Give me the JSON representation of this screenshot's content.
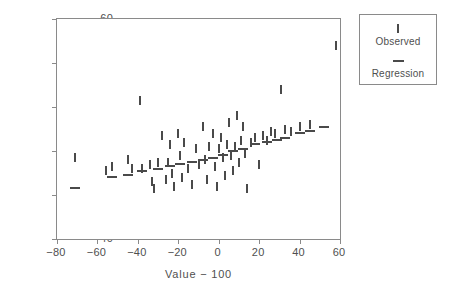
{
  "chart_data": {
    "type": "scatter",
    "title": "",
    "xlabel": "Value − 100",
    "ylabel": "",
    "xlim": [
      -80,
      60
    ],
    "ylim": [
      -40,
      60
    ],
    "xticks": [
      -80,
      -60,
      -40,
      -20,
      0,
      20,
      40,
      60
    ],
    "yticks": [
      -40,
      -20,
      0,
      20,
      40,
      60
    ],
    "xtick_labels": [
      "−80",
      "−60",
      "−40",
      "−20",
      "0",
      "20",
      "40",
      "60"
    ],
    "ytick_labels": [
      "−40",
      "−20",
      "0",
      "20",
      "40",
      "60"
    ],
    "grid": false,
    "background": "#ffffff",
    "frame_color": "#8a8a8a",
    "marker_color": "#4a4a4a",
    "legend": {
      "position": "outside-top-right",
      "entries": [
        {
          "label": "Observed",
          "marker": "vertical-tick"
        },
        {
          "label": "Regression",
          "marker": "horizontal-dash"
        }
      ]
    },
    "series": [
      {
        "name": "Observed",
        "marker": "vertical-tick",
        "points": [
          [
            -71,
            -3
          ],
          [
            -56,
            -9
          ],
          [
            -53,
            -7
          ],
          [
            -45,
            -4
          ],
          [
            -43,
            -8
          ],
          [
            -39,
            23
          ],
          [
            -38,
            -8
          ],
          [
            -34,
            -6
          ],
          [
            -33,
            -14
          ],
          [
            -32,
            -17
          ],
          [
            -30,
            -5
          ],
          [
            -28,
            7
          ],
          [
            -26,
            -13
          ],
          [
            -25,
            -5
          ],
          [
            -24,
            3
          ],
          [
            -23,
            -10
          ],
          [
            -22,
            -16
          ],
          [
            -20,
            8
          ],
          [
            -19,
            -2
          ],
          [
            -18,
            -12
          ],
          [
            -17,
            4
          ],
          [
            -15,
            -8
          ],
          [
            -13,
            -15
          ],
          [
            -11,
            1
          ],
          [
            -10,
            -6
          ],
          [
            -8,
            11
          ],
          [
            -7,
            -4
          ],
          [
            -6,
            -13
          ],
          [
            -5,
            2
          ],
          [
            -3,
            8
          ],
          [
            -2,
            -7
          ],
          [
            -1,
            -16
          ],
          [
            0,
            1
          ],
          [
            1,
            6
          ],
          [
            2,
            -3
          ],
          [
            3,
            -11
          ],
          [
            4,
            3
          ],
          [
            5,
            13
          ],
          [
            6,
            -2
          ],
          [
            7,
            -9
          ],
          [
            8,
            2
          ],
          [
            9,
            16
          ],
          [
            10,
            -5
          ],
          [
            11,
            5
          ],
          [
            12,
            11
          ],
          [
            13,
            -1
          ],
          [
            14,
            -17
          ],
          [
            16,
            4
          ],
          [
            18,
            6
          ],
          [
            20,
            -6
          ],
          [
            22,
            7
          ],
          [
            24,
            5
          ],
          [
            26,
            9
          ],
          [
            28,
            8
          ],
          [
            31,
            28
          ],
          [
            33,
            10
          ],
          [
            36,
            9
          ],
          [
            40,
            11
          ],
          [
            45,
            12
          ],
          [
            58,
            48
          ]
        ]
      },
      {
        "name": "Regression",
        "marker": "horizontal-dash",
        "points": [
          [
            -71,
            -17
          ],
          [
            -53,
            -12
          ],
          [
            -45,
            -11
          ],
          [
            -38,
            -9
          ],
          [
            -30,
            -8
          ],
          [
            -24,
            -7
          ],
          [
            -19,
            -6
          ],
          [
            -13,
            -5
          ],
          [
            -8,
            -4
          ],
          [
            -3,
            -3
          ],
          [
            2,
            -2
          ],
          [
            7,
            0
          ],
          [
            12,
            1
          ],
          [
            18,
            3
          ],
          [
            24,
            4
          ],
          [
            29,
            5
          ],
          [
            33,
            6
          ],
          [
            40,
            8
          ],
          [
            45,
            9
          ],
          [
            52,
            11
          ]
        ]
      }
    ]
  }
}
